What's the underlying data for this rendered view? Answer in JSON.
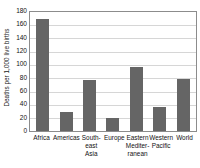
{
  "chart_data": {
    "type": "bar",
    "title": "",
    "xlabel": "",
    "ylabel": "Deaths per 1,000 live births",
    "categories": [
      "Africa",
      "South-east Asia",
      "Americas",
      "Europe",
      "Eastern Mediterranean",
      "Western Pacific",
      "World"
    ],
    "category_label_lines": [
      [
        "Africa"
      ],
      [
        "Americas"
      ],
      [
        "South-",
        "east",
        "Asia"
      ],
      [
        "Europe"
      ],
      [
        "Eastern",
        "Mediter-",
        "ranean"
      ],
      [
        "Western",
        "Pacific"
      ],
      [
        "World"
      ]
    ],
    "bars": [
      {
        "label": "Africa",
        "value": 168
      },
      {
        "label": "Americas",
        "value": 28
      },
      {
        "label": "South-east Asia",
        "value": 77
      },
      {
        "label": "Europe",
        "value": 20
      },
      {
        "label": "Eastern Mediterranean",
        "value": 96
      },
      {
        "label": "Western Pacific",
        "value": 36
      },
      {
        "label": "World",
        "value": 78
      }
    ],
    "values": [
      168,
      28,
      77,
      20,
      96,
      36,
      78
    ],
    "ylim": [
      0,
      180
    ],
    "ytick_step": 20,
    "yticks": [
      0,
      20,
      40,
      60,
      80,
      100,
      120,
      140,
      160,
      180
    ],
    "grid": true,
    "legend": false,
    "colors": {
      "bar_fill": "#656565",
      "gridline": "#d6d6d6",
      "axis_border": "#8c8c8c",
      "background": "#ffffff",
      "text": "#111111"
    }
  }
}
